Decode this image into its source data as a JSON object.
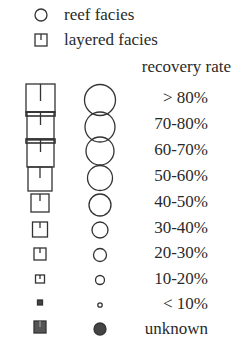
{
  "legend": {
    "facies": [
      {
        "symbol": "circle-icon",
        "label": "reef facies"
      },
      {
        "symbol": "square-tick-icon",
        "label": "layered facies"
      }
    ],
    "recovery_title": "recovery rate",
    "rates": [
      {
        "label": "> 80%",
        "square_size": 28,
        "circle_r": 15
      },
      {
        "label": "70-80%",
        "square_size": 26,
        "circle_r": 15
      },
      {
        "label": "60-70%",
        "square_size": 26,
        "circle_r": 14
      },
      {
        "label": "50-60%",
        "square_size": 24,
        "circle_r": 13
      },
      {
        "label": "40-50%",
        "square_size": 18,
        "circle_r": 11
      },
      {
        "label": "30-40%",
        "square_size": 15,
        "circle_r": 8
      },
      {
        "label": "20-30%",
        "square_size": 12,
        "circle_r": 7
      },
      {
        "label": "10-20%",
        "square_size": 9,
        "circle_r": 5
      },
      {
        "label": "< 10%",
        "square_size": 5,
        "circle_r": 2.5
      },
      {
        "label": "unknown",
        "square_size": 12,
        "circle_r": 6,
        "filled": true
      }
    ],
    "colors": {
      "stroke": "#333333",
      "fill_unknown": "#444444",
      "text": "#2a2a2a"
    }
  }
}
